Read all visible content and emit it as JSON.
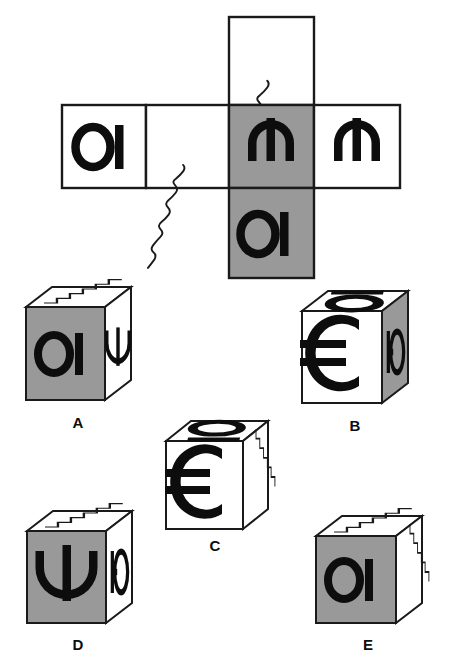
{
  "figure": {
    "type": "cube-folding-puzzle",
    "colors": {
      "shaded_face": "#999999",
      "plain_face": "#ffffff",
      "outline": "#1a1a1a",
      "glyph": "#0d0d0d",
      "background": "#ffffff"
    }
  },
  "net": {
    "name": "cube-net",
    "layout": "cross / T shaped net of six squares",
    "squares": [
      {
        "id": "net-top",
        "position": "top",
        "fill": "white",
        "content": "wavy-diagonal-line"
      },
      {
        "id": "net-left",
        "position": "row-left",
        "fill": "white",
        "content": "glyph-oi"
      },
      {
        "id": "net-middle-left",
        "position": "row-mid-left",
        "fill": "white",
        "content": "wavy-diagonal-line"
      },
      {
        "id": "net-center",
        "position": "row-center",
        "fill": "gray",
        "content": "glyph-psi-inverted"
      },
      {
        "id": "net-right",
        "position": "row-right",
        "fill": "white",
        "content": "glyph-psi-inverted"
      },
      {
        "id": "net-bottom",
        "position": "bottom",
        "fill": "gray",
        "content": "glyph-oi"
      }
    ],
    "glyph_names": {
      "glyph-oi": "circle-with-vertical-bar",
      "glyph-psi-inverted": "inverted-psi",
      "wavy-diagonal-line": "sine-wave-diagonal"
    }
  },
  "options": [
    {
      "label": "A",
      "name": "cube-option-a",
      "front": {
        "fill": "gray",
        "content": "glyph-oi",
        "glyph": "circle-with-vertical-bar"
      },
      "right": {
        "fill": "white",
        "content": "glyph-psi",
        "glyph": "psi"
      },
      "top": {
        "fill": "white",
        "content": "zigzag-diagonal",
        "glyph": "staircase-sawtooth"
      }
    },
    {
      "label": "B",
      "name": "cube-option-b",
      "front": {
        "fill": "white",
        "content": "glyph-euro",
        "glyph": "euro-sign"
      },
      "right": {
        "fill": "gray",
        "content": "glyph-yu",
        "glyph": "bar-with-circle"
      },
      "top": {
        "fill": "white",
        "content": "glyph-hieuh",
        "glyph": "oval-with-bar-above"
      }
    },
    {
      "label": "C",
      "name": "cube-option-c",
      "front": {
        "fill": "white",
        "content": "glyph-euro",
        "glyph": "euro-sign"
      },
      "right": {
        "fill": "white",
        "content": "zigzag-vertical",
        "glyph": "staircase-sawtooth"
      },
      "top": {
        "fill": "white",
        "content": "glyph-q",
        "glyph": "oval-with-bar-below"
      }
    },
    {
      "label": "D",
      "name": "cube-option-d",
      "front": {
        "fill": "gray",
        "content": "glyph-psi",
        "glyph": "psi"
      },
      "right": {
        "fill": "white",
        "content": "glyph-yu",
        "glyph": "bar-with-circle"
      },
      "top": {
        "fill": "white",
        "content": "zigzag-diagonal",
        "glyph": "staircase-sawtooth"
      }
    },
    {
      "label": "E",
      "name": "cube-option-e",
      "front": {
        "fill": "gray",
        "content": "glyph-oi",
        "glyph": "circle-with-vertical-bar"
      },
      "right": {
        "fill": "white",
        "content": "zigzag-vertical",
        "glyph": "staircase-sawtooth"
      },
      "top": {
        "fill": "white",
        "content": "zigzag-diagonal",
        "glyph": "staircase-sawtooth"
      }
    }
  ],
  "option_labels": {
    "a": "A",
    "b": "B",
    "c": "C",
    "d": "D",
    "e": "E"
  },
  "glyph_chars": {
    "oi": "ОІ",
    "psi": "Ψ",
    "psi_inverted": "Ψ",
    "euro": "€",
    "yu": "Ю"
  }
}
